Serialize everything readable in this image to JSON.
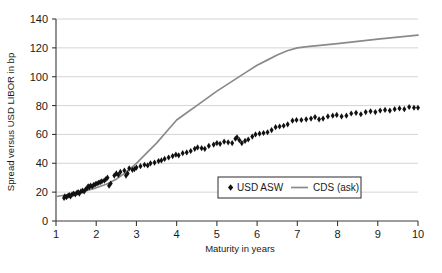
{
  "chart_data": {
    "type": "scatter",
    "title": "",
    "xlabel": "Maturity in years",
    "ylabel": "Spread versus USD LIBOR in bp",
    "xlim": [
      1,
      10
    ],
    "ylim": [
      0,
      140
    ],
    "xticks": [
      1,
      2,
      3,
      4,
      5,
      6,
      7,
      8,
      9,
      10
    ],
    "yticks": [
      0,
      20,
      40,
      60,
      80,
      100,
      120,
      140
    ],
    "grid": "horizontal",
    "legend_position": "bottom-center-inside",
    "series": [
      {
        "name": "USD ASW",
        "type": "scatter",
        "marker": "diamond",
        "color": "#111111",
        "points": [
          [
            1.2,
            16.0
          ],
          [
            1.22,
            17.0
          ],
          [
            1.26,
            16.5
          ],
          [
            1.3,
            17.5
          ],
          [
            1.33,
            18.0
          ],
          [
            1.36,
            17.0
          ],
          [
            1.4,
            18.5
          ],
          [
            1.44,
            19.0
          ],
          [
            1.48,
            18.5
          ],
          [
            1.52,
            19.5
          ],
          [
            1.55,
            20.0
          ],
          [
            1.58,
            19.0
          ],
          [
            1.62,
            20.5
          ],
          [
            1.66,
            21.0
          ],
          [
            1.7,
            20.5
          ],
          [
            1.74,
            22.0
          ],
          [
            1.78,
            23.0
          ],
          [
            1.8,
            24.0
          ],
          [
            1.83,
            23.5
          ],
          [
            1.86,
            24.5
          ],
          [
            1.9,
            24.0
          ],
          [
            1.94,
            25.0
          ],
          [
            1.98,
            25.5
          ],
          [
            2.02,
            26.0
          ],
          [
            2.06,
            26.5
          ],
          [
            2.1,
            27.0
          ],
          [
            2.14,
            27.5
          ],
          [
            2.2,
            28.0
          ],
          [
            2.24,
            29.0
          ],
          [
            2.28,
            30.0
          ],
          [
            2.32,
            24.5
          ],
          [
            2.36,
            26.0
          ],
          [
            2.45,
            31.5
          ],
          [
            2.5,
            33.0
          ],
          [
            2.55,
            32.0
          ],
          [
            2.6,
            34.0
          ],
          [
            2.7,
            35.0
          ],
          [
            2.74,
            31.5
          ],
          [
            2.78,
            33.0
          ],
          [
            2.82,
            36.5
          ],
          [
            2.9,
            35.5
          ],
          [
            2.95,
            36.0
          ],
          [
            3.0,
            37.0
          ],
          [
            3.1,
            38.0
          ],
          [
            3.2,
            39.0
          ],
          [
            3.28,
            38.5
          ],
          [
            3.35,
            40.0
          ],
          [
            3.45,
            40.5
          ],
          [
            3.55,
            41.5
          ],
          [
            3.62,
            42.0
          ],
          [
            3.7,
            43.0
          ],
          [
            3.8,
            44.0
          ],
          [
            3.9,
            45.0
          ],
          [
            3.98,
            46.0
          ],
          [
            4.05,
            45.5
          ],
          [
            4.15,
            47.0
          ],
          [
            4.25,
            47.5
          ],
          [
            4.35,
            48.5
          ],
          [
            4.45,
            50.0
          ],
          [
            4.52,
            51.0
          ],
          [
            4.62,
            50.5
          ],
          [
            4.7,
            50.0
          ],
          [
            4.8,
            52.0
          ],
          [
            4.92,
            53.0
          ],
          [
            5.0,
            54.0
          ],
          [
            5.08,
            53.5
          ],
          [
            5.18,
            55.0
          ],
          [
            5.28,
            54.5
          ],
          [
            5.38,
            54.0
          ],
          [
            5.46,
            57.0
          ],
          [
            5.5,
            58.0
          ],
          [
            5.56,
            56.0
          ],
          [
            5.62,
            54.0
          ],
          [
            5.7,
            55.5
          ],
          [
            5.78,
            56.5
          ],
          [
            5.88,
            58.5
          ],
          [
            5.96,
            60.0
          ],
          [
            6.06,
            60.5
          ],
          [
            6.16,
            61.0
          ],
          [
            6.26,
            61.5
          ],
          [
            6.36,
            63.0
          ],
          [
            6.46,
            65.0
          ],
          [
            6.56,
            65.5
          ],
          [
            6.66,
            66.0
          ],
          [
            6.76,
            67.0
          ],
          [
            6.88,
            69.5
          ],
          [
            6.98,
            70.0
          ],
          [
            7.1,
            70.0
          ],
          [
            7.22,
            70.5
          ],
          [
            7.34,
            71.0
          ],
          [
            7.44,
            72.0
          ],
          [
            7.54,
            70.5
          ],
          [
            7.64,
            71.0
          ],
          [
            7.76,
            72.5
          ],
          [
            7.88,
            73.0
          ],
          [
            7.98,
            73.5
          ],
          [
            8.1,
            72.5
          ],
          [
            8.22,
            73.0
          ],
          [
            8.34,
            74.5
          ],
          [
            8.46,
            75.0
          ],
          [
            8.58,
            74.0
          ],
          [
            8.7,
            75.5
          ],
          [
            8.82,
            76.0
          ],
          [
            8.94,
            75.5
          ],
          [
            9.06,
            76.5
          ],
          [
            9.18,
            77.0
          ],
          [
            9.3,
            76.5
          ],
          [
            9.42,
            77.5
          ],
          [
            9.54,
            78.0
          ],
          [
            9.66,
            77.5
          ],
          [
            9.78,
            79.0
          ],
          [
            9.9,
            78.5
          ],
          [
            10.0,
            78.5
          ]
        ]
      },
      {
        "name": "CDS (ask)",
        "type": "line",
        "color": "#8a8a8a",
        "points": [
          [
            1.0,
            17.0
          ],
          [
            1.25,
            18.0
          ],
          [
            1.5,
            19.5
          ],
          [
            1.75,
            21.0
          ],
          [
            2.0,
            23.0
          ],
          [
            2.25,
            25.5
          ],
          [
            2.5,
            29.0
          ],
          [
            2.75,
            34.0
          ],
          [
            3.0,
            40.0
          ],
          [
            3.25,
            47.0
          ],
          [
            3.5,
            54.0
          ],
          [
            3.75,
            62.0
          ],
          [
            4.0,
            70.0
          ],
          [
            4.25,
            75.0
          ],
          [
            4.5,
            80.0
          ],
          [
            4.75,
            85.0
          ],
          [
            5.0,
            90.0
          ],
          [
            5.25,
            94.5
          ],
          [
            5.5,
            99.0
          ],
          [
            5.75,
            103.5
          ],
          [
            6.0,
            108.0
          ],
          [
            6.25,
            111.5
          ],
          [
            6.5,
            115.0
          ],
          [
            6.75,
            118.0
          ],
          [
            7.0,
            120.0
          ],
          [
            7.25,
            120.8
          ],
          [
            7.5,
            121.5
          ],
          [
            8.0,
            123.0
          ],
          [
            8.5,
            124.5
          ],
          [
            9.0,
            126.0
          ],
          [
            9.5,
            127.5
          ],
          [
            10.0,
            128.8
          ]
        ]
      }
    ],
    "legend": [
      {
        "label": "USD ASW",
        "marker": "diamond",
        "color": "#111111"
      },
      {
        "label": "CDS (ask)",
        "marker": "line",
        "color": "#8a8a8a"
      }
    ]
  },
  "colors": {
    "line": "#8a8a8a",
    "marker": "#111111",
    "axis": "#3a3a3a",
    "grid": "#c9c9c9",
    "background": "#ffffff"
  }
}
